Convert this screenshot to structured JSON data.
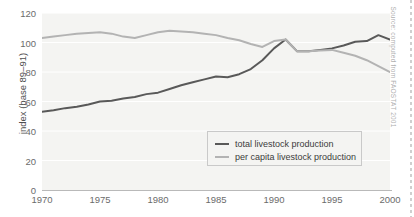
{
  "figure": {
    "top_fragment": "",
    "source_note": "Source: computed from FAOSTAT 2001"
  },
  "chart_data": {
    "type": "line",
    "title": "",
    "xlabel": "",
    "ylabel": "index (base 89–91)",
    "xlim": [
      1970,
      2000
    ],
    "ylim": [
      0,
      120
    ],
    "grid": true,
    "grid_axis": "y",
    "legend_position": "lower-right",
    "x_ticks": [
      "1970",
      "1975",
      "1980",
      "1985",
      "1990",
      "1995",
      "2000"
    ],
    "y_ticks": [
      "0",
      "20",
      "40",
      "60",
      "80",
      "100",
      "120"
    ],
    "x": [
      1970,
      1971,
      1972,
      1973,
      1974,
      1975,
      1976,
      1977,
      1978,
      1979,
      1980,
      1981,
      1982,
      1983,
      1984,
      1985,
      1986,
      1987,
      1988,
      1989,
      1990,
      1991,
      1992,
      1993,
      1994,
      1995,
      1996,
      1997,
      1998,
      1999,
      2000
    ],
    "series": [
      {
        "name": "total livestock production",
        "color": "#595959",
        "values": [
          53,
          54,
          55.5,
          56.5,
          58,
          60,
          60.5,
          62,
          63,
          65,
          66,
          68.5,
          71,
          73,
          75,
          77,
          76.5,
          78.5,
          82,
          88,
          96,
          102,
          94,
          94,
          95,
          96,
          98,
          100.5,
          101,
          105,
          102
        ]
      },
      {
        "name": "per capita livestock production",
        "color": "#b3b3b3",
        "values": [
          103,
          104,
          105,
          106,
          106.5,
          107,
          106,
          104,
          103,
          105,
          107,
          108,
          107.5,
          107,
          106,
          105,
          103,
          101.5,
          99,
          97,
          101,
          102,
          94,
          94,
          94.5,
          95,
          93,
          91,
          88,
          84,
          80
        ]
      }
    ]
  },
  "legend": {
    "items": [
      {
        "label": "total livestock production",
        "color": "#595959"
      },
      {
        "label": "per capita livestock production",
        "color": "#b3b3b3"
      }
    ]
  }
}
